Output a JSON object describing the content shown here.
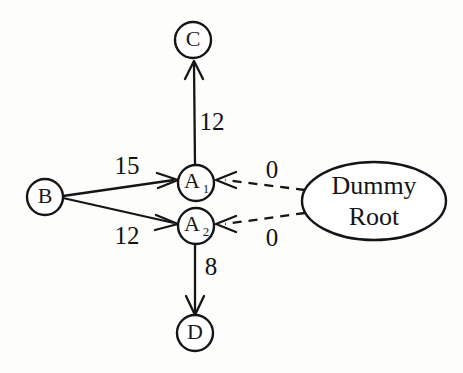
{
  "figure": {
    "type": "directed-graph",
    "background_color": "#fdfdfb",
    "stroke_color": "#151515"
  },
  "nodes": [
    {
      "id": "C",
      "label": "C",
      "sub": "",
      "shape": "circle",
      "cx": 193,
      "cy": 40,
      "r": 18
    },
    {
      "id": "A1",
      "label": "A",
      "sub": "1",
      "shape": "circle",
      "cx": 196,
      "cy": 183,
      "r": 18
    },
    {
      "id": "A2",
      "label": "A",
      "sub": "2",
      "shape": "circle",
      "cx": 196,
      "cy": 226,
      "r": 18
    },
    {
      "id": "B",
      "label": "B",
      "sub": "",
      "shape": "circle",
      "cx": 45,
      "cy": 197,
      "r": 18
    },
    {
      "id": "D",
      "label": "D",
      "sub": "",
      "shape": "circle",
      "cx": 195,
      "cy": 333,
      "r": 18
    },
    {
      "id": "DummyRoot",
      "label_line1": "Dummy",
      "label_line2": "Root",
      "shape": "ellipse",
      "cx": 374,
      "cy": 201,
      "rx": 72,
      "ry": 39
    }
  ],
  "edges": [
    {
      "id": "A1-C",
      "from": "A1",
      "to": "C",
      "weight": "12",
      "style": "solid",
      "label_x": 212,
      "label_y": 124
    },
    {
      "id": "B-A1",
      "from": "B",
      "to": "A1",
      "weight": "15",
      "style": "solid",
      "label_x": 127,
      "label_y": 168
    },
    {
      "id": "B-A2",
      "from": "B",
      "to": "A2",
      "weight": "12",
      "style": "solid",
      "label_x": 127,
      "label_y": 238
    },
    {
      "id": "A2-D",
      "from": "A2",
      "to": "D",
      "weight": "8",
      "style": "solid",
      "label_x": 211,
      "label_y": 269
    },
    {
      "id": "Root-A1",
      "from": "DummyRoot",
      "to": "A1",
      "weight": "0",
      "style": "dashed",
      "label_x": 272,
      "label_y": 172
    },
    {
      "id": "Root-A2",
      "from": "DummyRoot",
      "to": "A2",
      "weight": "0",
      "style": "dashed",
      "label_x": 272,
      "label_y": 240
    }
  ]
}
